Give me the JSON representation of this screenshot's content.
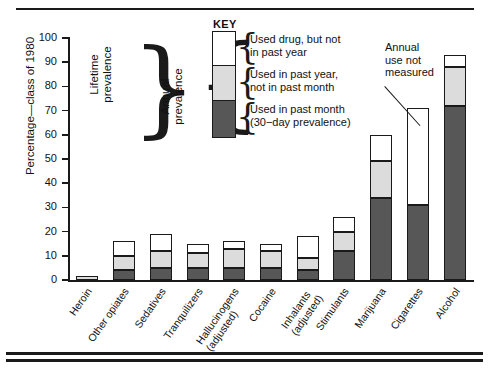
{
  "figure": {
    "y_axis_title": "Percentage—class of 1980",
    "key_title": "KEY"
  },
  "key": {
    "items": [
      {
        "swatch": "white",
        "line1": "Used drug, but not",
        "line2": "in past year"
      },
      {
        "swatch": "gray",
        "line1": "Used in past year,",
        "line2": "not in past month"
      },
      {
        "swatch": "dark",
        "line1": "Used in past month",
        "line2": "(30−day prevalence)"
      }
    ]
  },
  "braces": {
    "lifetime": "Lifetime\nprevalence",
    "annual": "Annual\nprevalence"
  },
  "annotation": {
    "text": "Annual\nuse not\nmeasured"
  },
  "chart_data": {
    "type": "bar",
    "title": "",
    "xlabel": "",
    "ylabel": "Percentage—class of 1980",
    "ylim": [
      0,
      100
    ],
    "yticks": [
      0,
      10,
      20,
      30,
      40,
      50,
      60,
      70,
      80,
      90,
      100
    ],
    "grid": false,
    "legend_position": "top-center",
    "stacked": true,
    "categories": [
      "Heroin",
      "Other opiates",
      "Sedatives",
      "Tranquilizers",
      "Hallucinogens\n(adjusted)",
      "Cocaine",
      "Inhalants\n(adjusted)",
      "Stimulants",
      "Marijuana",
      "Cigarettes",
      "Alcohol"
    ],
    "series": [
      {
        "name": "Used in past month (30-day prevalence)",
        "color": "#575757",
        "values": [
          0,
          4,
          5,
          5,
          5,
          5,
          4,
          12,
          34,
          31,
          72
        ]
      },
      {
        "name": "Used in past year, not in past month",
        "color": "#dcdcdc",
        "values": [
          1.5,
          6,
          7,
          6,
          8,
          7,
          5,
          8,
          15,
          0,
          16
        ]
      },
      {
        "name": "Used drug, but not in past year",
        "color": "#ffffff",
        "values": [
          0,
          6,
          7,
          4,
          3,
          3,
          9,
          6,
          11,
          40,
          5
        ]
      }
    ],
    "totals": [
      1.5,
      16,
      19,
      15,
      16,
      15,
      18,
      26,
      60,
      71,
      93
    ]
  }
}
